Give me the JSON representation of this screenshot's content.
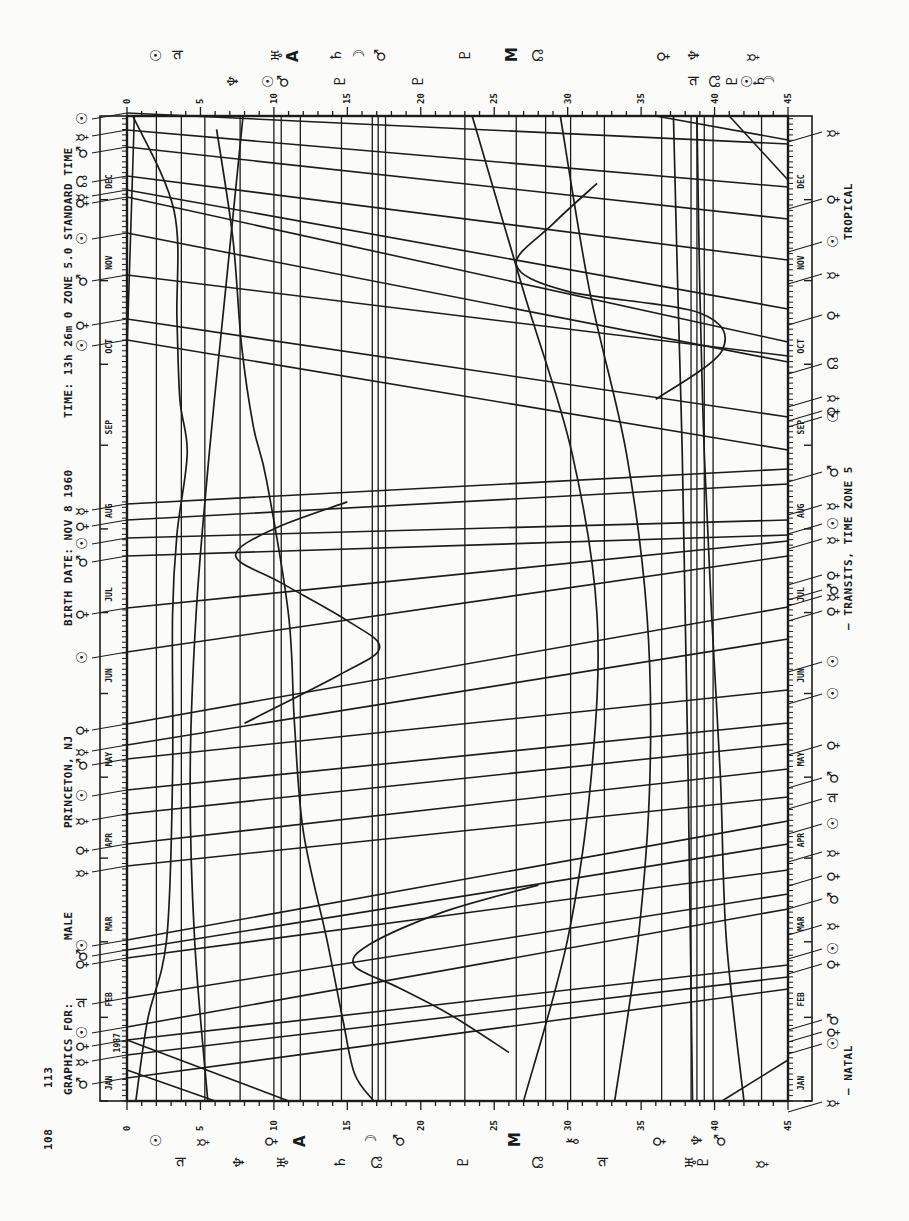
{
  "page": {
    "page_number": "108",
    "figure_number": "113",
    "orientation": "rotated 90 degrees counter-clockwise"
  },
  "header": {
    "graphics_for_label": "GRAPHICS FOR:",
    "graphics_for_value": "MALE",
    "location": "PRINCETON, NJ",
    "birth_date": "BIRTH DATE: NOV 8 1960",
    "time": "TIME: 13h 26m 0 ZONE 5.0 STANDARD TIME"
  },
  "footer": {
    "natal_legend": "— NATAL",
    "transits_legend": "— TRANSITS, TIME ZONE 5",
    "zodiac": "TROPICAL"
  },
  "chart_data": {
    "type": "line",
    "xlabel": "Degrees (0–45, modulo 45)",
    "ylabel": "Date (1987)",
    "xlim": [
      0,
      45
    ],
    "x_ticks": [
      0,
      5,
      10,
      15,
      20,
      25,
      30,
      35,
      40,
      45
    ],
    "year": "1987",
    "months": [
      "JAN",
      "FEB",
      "MAR",
      "APR",
      "MAY",
      "JUN",
      "JUL",
      "AUG",
      "SEP",
      "OCT",
      "NOV",
      "DEC"
    ],
    "grid": false,
    "natal_positions": [
      {
        "symbol": "☉",
        "name": "Sun",
        "deg": 2.0
      },
      {
        "symbol": "♃",
        "name": "Jupiter",
        "deg": 3.7
      },
      {
        "symbol": "☿",
        "name": "Mercury",
        "deg": 5.3
      },
      {
        "symbol": "♆",
        "name": "Neptune",
        "deg": 7.7
      },
      {
        "symbol": "♀",
        "name": "Venus",
        "deg": 10.0
      },
      {
        "symbol": "♅",
        "name": "Uranus",
        "deg": 10.5
      },
      {
        "symbol": "A",
        "name": "Ascendant",
        "deg": 11.8
      },
      {
        "symbol": "♄",
        "name": "Saturn",
        "deg": 14.6
      },
      {
        "symbol": "☽",
        "name": "Moon",
        "deg": 16.7
      },
      {
        "symbol": "☊",
        "name": "Node",
        "deg": 17.1
      },
      {
        "symbol": "♂",
        "name": "Mars",
        "deg": 17.6
      },
      {
        "symbol": "♇",
        "name": "Pluto",
        "deg": 23.0
      },
      {
        "symbol": "M",
        "name": "Midheaven",
        "deg": 26.5
      },
      {
        "symbol": "☊",
        "name": "Node (2)",
        "deg": 28.5
      },
      {
        "symbol": "⚷",
        "name": "Chiron",
        "deg": 30.2
      },
      {
        "symbol": "♃",
        "name": "Jupiter (2)",
        "deg": 32.5
      },
      {
        "symbol": "♀",
        "name": "Venus (2)",
        "deg": 36.4
      },
      {
        "symbol": "♅",
        "name": "Uranus (2)",
        "deg": 38.4
      },
      {
        "symbol": "♆",
        "name": "Neptune (2)",
        "deg": 38.8
      },
      {
        "symbol": "♇",
        "name": "Pluto (2)",
        "deg": 39.3
      },
      {
        "symbol": "♂",
        "name": "Mars (2)",
        "deg": 39.9
      },
      {
        "symbol": "☿",
        "name": "Mercury (2)",
        "deg": 43.2
      }
    ],
    "slow_transits": [
      {
        "name": "Uranus-like curve",
        "points": [
          [
            5.5,
            0
          ],
          [
            4.6,
            60
          ],
          [
            4.3,
            120
          ],
          [
            4.7,
            180
          ],
          [
            5.6,
            240
          ],
          [
            6.7,
            300
          ],
          [
            7.9,
            365
          ]
        ]
      },
      {
        "name": "Neptune arc",
        "points": [
          [
            0.6,
            0
          ],
          [
            1.4,
            30
          ],
          [
            2.7,
            60
          ],
          [
            3.1,
            120
          ],
          [
            3.1,
            180
          ],
          [
            3.4,
            210
          ],
          [
            4.1,
            240
          ],
          [
            3.6,
            260
          ],
          [
            3.4,
            290
          ],
          [
            3.2,
            330
          ],
          [
            0.4,
            365
          ]
        ]
      },
      {
        "name": "Pluto arc (left wiggle)",
        "points": [
          [
            16.8,
            0
          ],
          [
            15.5,
            10
          ],
          [
            14.7,
            30
          ],
          [
            13.6,
            60
          ],
          [
            12.0,
            100
          ],
          [
            11.4,
            140
          ],
          [
            11.0,
            180
          ],
          [
            9.5,
            230
          ],
          [
            8.6,
            250
          ],
          [
            7.8,
            280
          ],
          [
            7.2,
            320
          ],
          [
            6.1,
            360
          ]
        ]
      },
      {
        "name": "Chiron arc",
        "points": [
          [
            27,
            0
          ],
          [
            30,
            60
          ],
          [
            31.6,
            120
          ],
          [
            32,
            180
          ],
          [
            30.3,
            240
          ],
          [
            27,
            300
          ],
          [
            23.5,
            365
          ]
        ]
      },
      {
        "name": "Saturn arc",
        "points": [
          [
            33.2,
            0
          ],
          [
            34.8,
            60
          ],
          [
            35.6,
            120
          ],
          [
            35.4,
            180
          ],
          [
            34.0,
            240
          ],
          [
            31.5,
            300
          ],
          [
            29.5,
            365
          ]
        ]
      },
      {
        "name": "Jupiter line",
        "points": [
          [
            38.5,
            0
          ],
          [
            38.2,
            120
          ],
          [
            38.0,
            180
          ],
          [
            37.8,
            240
          ],
          [
            37.5,
            300
          ],
          [
            37.2,
            365
          ]
        ]
      },
      {
        "name": "Pluto steep",
        "points": [
          [
            42,
            0
          ],
          [
            40.8,
            60
          ],
          [
            40.4,
            120
          ],
          [
            39.8,
            180
          ],
          [
            39.3,
            240
          ],
          [
            39,
            300
          ],
          [
            38.8,
            365
          ]
        ]
      }
    ],
    "mars_loops": [
      {
        "name": "Mercury retrograde loop 1",
        "points": [
          [
            26.0,
            18
          ],
          [
            22.0,
            32
          ],
          [
            18.5,
            42
          ],
          [
            15.5,
            50
          ],
          [
            16.5,
            58
          ],
          [
            21.5,
            70
          ],
          [
            28,
            80
          ]
        ]
      },
      {
        "name": "Mercury retrograde loop 2",
        "points": [
          [
            8,
            140
          ],
          [
            14.5,
            158
          ],
          [
            17.2,
            168
          ],
          [
            15,
            178
          ],
          [
            10.5,
            192
          ],
          [
            7.4,
            202
          ],
          [
            10,
            212
          ],
          [
            15,
            222
          ]
        ]
      },
      {
        "name": "Mercury retrograde loop 3",
        "points": [
          [
            36,
            260
          ],
          [
            40.5,
            278
          ],
          [
            39,
            292
          ],
          [
            30,
            300
          ],
          [
            26.5,
            310
          ],
          [
            29,
            325
          ],
          [
            32,
            340
          ]
        ]
      }
    ],
    "fast_transits_note": "Dozens of near-horizontal lines represent fast-moving transiting planets (Sun, Mercury, Venus, Mars) crossing the 45° dial repeatedly; each labelled on date strips with the natal planet symbol it activates."
  },
  "left_date_labels": {
    "symbols": [
      "♂",
      "☿",
      "♀",
      "☉",
      "♃",
      "♀",
      "♂",
      "☉",
      "☿",
      "♀",
      "☿",
      "☉",
      "♂",
      "☿",
      "♀",
      "☉",
      "♀",
      "♂",
      "☉",
      "♀",
      "☿",
      "☉",
      "♀",
      "♂",
      "☉",
      "♀",
      "☿",
      "☊",
      "♂",
      "☿",
      "☉"
    ],
    "positions_y": [
      1078,
      1055,
      1040,
      1027,
      998,
      958,
      950,
      940,
      866,
      844,
      814,
      790,
      759,
      745,
      724,
      652,
      608,
      556,
      538,
      520,
      504,
      340,
      319,
      275,
      233,
      197,
      190,
      176,
      147,
      130,
      113
    ]
  },
  "right_date_labels": {
    "symbols": [
      "☿",
      "☉",
      "♀",
      "♂",
      "♀",
      "☉",
      "☿",
      "♂",
      "♀",
      "☿",
      "☉",
      "♃",
      "♂",
      "♀",
      "☉",
      "☉",
      "♀",
      "☿",
      "♂",
      "♀",
      "☿",
      "☉",
      "☿",
      "♂",
      "♀",
      "☉",
      "☿",
      "☊",
      "♀",
      "☿",
      "☉",
      "♀",
      "☿"
    ],
    "positions_y": [
      1108,
      1050,
      1038,
      1026,
      970,
      955,
      931,
      905,
      882,
      858,
      830,
      805,
      784,
      751,
      700,
      668,
      617,
      602,
      596,
      581,
      545,
      530,
      511,
      478,
      417,
      423,
      403,
      370,
      321,
      280,
      248,
      205,
      138
    ]
  },
  "bottom_labels": [
    {
      "symbol": "☉",
      "deg": 2.0
    },
    {
      "symbol": "♃",
      "deg": 3.7
    },
    {
      "symbol": "☿",
      "deg": 5.2
    },
    {
      "symbol": "♆",
      "deg": 7.6
    },
    {
      "symbol": "♀",
      "deg": 9.8
    },
    {
      "symbol": "♅",
      "deg": 10.6
    },
    {
      "symbol": "A",
      "deg": 11.8
    },
    {
      "symbol": "♄",
      "deg": 14.5
    },
    {
      "symbol": "☽",
      "deg": 16.6
    },
    {
      "symbol": "☊",
      "deg": 17.0
    },
    {
      "symbol": "♂",
      "deg": 18.5
    },
    {
      "symbol": "♇",
      "deg": 22.9
    },
    {
      "symbol": "M",
      "deg": 26.4
    },
    {
      "symbol": "☊",
      "deg": 28.0
    },
    {
      "symbol": "⚷",
      "deg": 30.3
    },
    {
      "symbol": "♃",
      "deg": 32.4
    },
    {
      "symbol": "♀",
      "deg": 36.2
    },
    {
      "symbol": "♅",
      "deg": 38.4
    },
    {
      "symbol": "♆",
      "deg": 38.8
    },
    {
      "symbol": "♇",
      "deg": 39.2
    },
    {
      "symbol": "♂",
      "deg": 40.4
    },
    {
      "symbol": "☿",
      "deg": 43.2
    }
  ],
  "top_labels": [
    {
      "symbol": "☉",
      "deg": 2.0,
      "row": 1
    },
    {
      "symbol": "♃",
      "deg": 3.5,
      "row": 1
    },
    {
      "symbol": "♆",
      "deg": 7.2,
      "row": 2
    },
    {
      "symbol": "☉",
      "deg": 9.6,
      "row": 2
    },
    {
      "symbol": "♂",
      "deg": 10.6,
      "row": 2
    },
    {
      "symbol": "♅",
      "deg": 10.2,
      "row": 1
    },
    {
      "symbol": "A",
      "deg": 11.3,
      "row": 1
    },
    {
      "symbol": "♄",
      "deg": 14.2,
      "row": 1
    },
    {
      "symbol": "♇",
      "deg": 14.5,
      "row": 2
    },
    {
      "symbol": "☽",
      "deg": 15.8,
      "row": 1
    },
    {
      "symbol": "♂",
      "deg": 17.2,
      "row": 1
    },
    {
      "symbol": "♇",
      "deg": 19.8,
      "row": 2
    },
    {
      "symbol": "♇",
      "deg": 23.0,
      "row": 1
    },
    {
      "symbol": "M",
      "deg": 26.2,
      "row": 1
    },
    {
      "symbol": "☊",
      "deg": 28.0,
      "row": 1
    },
    {
      "symbol": "♀",
      "deg": 36.5,
      "row": 1
    },
    {
      "symbol": "♆",
      "deg": 38.6,
      "row": 1
    },
    {
      "symbol": "♃",
      "deg": 38.6,
      "row": 2
    },
    {
      "symbol": "☊",
      "deg": 40.0,
      "row": 2
    },
    {
      "symbol": "♇",
      "deg": 41.2,
      "row": 2
    },
    {
      "symbol": "☿",
      "deg": 42.6,
      "row": 1
    },
    {
      "symbol": "☉",
      "deg": 42.2,
      "row": 2
    },
    {
      "symbol": "♄",
      "deg": 43.0,
      "row": 2
    },
    {
      "symbol": "☽",
      "deg": 43.7,
      "row": 2
    }
  ]
}
